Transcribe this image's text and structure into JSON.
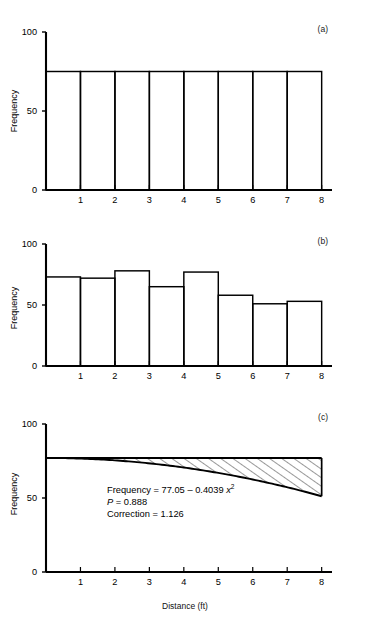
{
  "figure": {
    "running_header": "",
    "footer_caption": "",
    "xlabel": "Distance (ft)",
    "ylabel": "Frequency",
    "panel_tags": [
      "(a)",
      "(b)",
      "(c)"
    ]
  },
  "axis": {
    "y_ticks": [
      "0",
      "50",
      "100"
    ],
    "y_tick_values": [
      0,
      50,
      100
    ],
    "x_ticks": [
      "1",
      "2",
      "3",
      "4",
      "5",
      "6",
      "7",
      "8"
    ],
    "x_tick_values": [
      1,
      2,
      3,
      4,
      5,
      6,
      7,
      8
    ],
    "ylim": [
      0,
      100
    ],
    "xlim": [
      0,
      8.3
    ]
  },
  "annotation": {
    "line1_lead": "Frequency = 77.05 ",
    "line1_minus": "–",
    "line1_coef": " 0.4039 ",
    "line1_var": "x",
    "line1_exp": "2",
    "line2_var": "P",
    "line2_rest": " = 0.888",
    "line3": "Correction = 1.126"
  },
  "colors": {
    "ink": "#000000",
    "hatch": "#000000",
    "background": "#ffffff"
  },
  "chart_data": [
    {
      "type": "bar",
      "panel": "(a)",
      "title": "",
      "xlabel": "",
      "ylabel": "Frequency",
      "categories": [
        "1",
        "2",
        "3",
        "4",
        "5",
        "6",
        "7",
        "8"
      ],
      "values": [
        75,
        75,
        75,
        75,
        75,
        75,
        75,
        75
      ],
      "ylim": [
        0,
        100
      ],
      "xlim": [
        0,
        8.3
      ],
      "grid": false,
      "legend": "none",
      "note": "Uniform histogram: all eight distance classes at frequency 75"
    },
    {
      "type": "bar",
      "panel": "(b)",
      "title": "",
      "xlabel": "",
      "ylabel": "Frequency",
      "categories": [
        "1",
        "2",
        "3",
        "4",
        "5",
        "6",
        "7",
        "8"
      ],
      "values": [
        73,
        72,
        78,
        65,
        77,
        58,
        51,
        53
      ],
      "ylim": [
        0,
        100
      ],
      "xlim": [
        0,
        8.3
      ],
      "grid": false,
      "legend": "none",
      "note": "Observed histogram declining with distance"
    },
    {
      "type": "area",
      "panel": "(c)",
      "title": "",
      "xlabel": "Distance (ft)",
      "ylabel": "Frequency",
      "ylim": [
        0,
        100
      ],
      "xlim": [
        0,
        8.3
      ],
      "grid": false,
      "legend": "none",
      "equation": "Frequency = 77.05 - 0.4039 x^2",
      "intercept": 77.05,
      "quadratic_coefficient": -0.4039,
      "p_value": 0.888,
      "correction": 1.126,
      "series": [
        {
          "name": "reference level",
          "x": [
            0,
            8
          ],
          "values": [
            77.05,
            77.05
          ]
        },
        {
          "name": "fitted curve",
          "x": [
            0,
            1,
            2,
            3,
            4,
            5,
            6,
            7,
            8
          ],
          "values": [
            77.05,
            76.65,
            75.43,
            73.42,
            70.59,
            66.95,
            62.51,
            57.26,
            51.2
          ]
        }
      ],
      "shaded_region": {
        "between": [
          "reference level",
          "fitted curve"
        ],
        "style": "diagonal-hatch"
      }
    }
  ]
}
